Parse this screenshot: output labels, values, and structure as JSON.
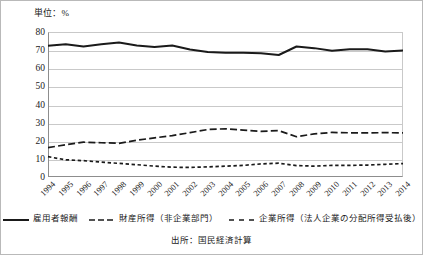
{
  "unit_label": "単位：%",
  "source": "出所：国民経済計算",
  "legend": {
    "items": [
      {
        "label": "雇用者報酬",
        "style": "solid"
      },
      {
        "label": "財産所得（非企業部門）",
        "style": "long-dash"
      },
      {
        "label": "企業所得（法人企業の分配所得受払後）",
        "style": "dash"
      }
    ]
  },
  "chart_data": {
    "type": "line",
    "title": "",
    "subtitle": "",
    "xlabel": "",
    "ylabel": "単位：%",
    "ylim": [
      0,
      80
    ],
    "ytick_step": 10,
    "yticks": [
      80,
      70,
      60,
      50,
      40,
      30,
      20,
      10,
      0
    ],
    "grid": true,
    "legend_position": "bottom",
    "categories": [
      "1994",
      "1995",
      "1996",
      "1997",
      "1998",
      "1999",
      "2000",
      "2001",
      "2002",
      "2003",
      "2004",
      "2005",
      "2006",
      "2007",
      "2008",
      "2009",
      "2010",
      "2011",
      "2012",
      "2013",
      "2014"
    ],
    "series": [
      {
        "name": "雇用者報酬",
        "style": "solid",
        "color": "#1a1a1a",
        "values": [
          72.4,
          73.2,
          72.0,
          73.2,
          74.2,
          72.6,
          71.7,
          72.6,
          70.3,
          69.0,
          68.5,
          68.6,
          68.3,
          67.3,
          72.0,
          71.1,
          69.6,
          70.5,
          70.5,
          69.2,
          69.8
        ]
      },
      {
        "name": "財産所得（非企業部門）",
        "style": "long-dash",
        "color": "#1a1a1a",
        "values": [
          16.2,
          17.8,
          19.2,
          18.9,
          18.6,
          20.3,
          21.6,
          22.8,
          24.5,
          26.2,
          26.6,
          25.9,
          25.2,
          25.6,
          22.2,
          23.8,
          24.6,
          24.4,
          24.3,
          24.5,
          24.3
        ]
      },
      {
        "name": "企業所得（法人企業の分配所得受払後）",
        "style": "dash",
        "color": "#1a1a1a",
        "values": [
          11.2,
          9.5,
          9.0,
          8.2,
          7.5,
          6.8,
          6.0,
          5.4,
          5.3,
          5.6,
          6.0,
          6.4,
          7.2,
          7.6,
          6.3,
          6.0,
          6.4,
          6.4,
          6.6,
          7.0,
          7.4
        ]
      }
    ]
  }
}
